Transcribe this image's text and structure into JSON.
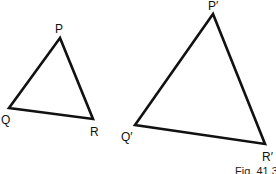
{
  "figure": {
    "caption": "Fig. 41.3",
    "stroke_color": "#111111",
    "background": "#ffffff"
  },
  "triangles": [
    {
      "name": "PQR",
      "vertices": {
        "P": {
          "label": "P",
          "x": 60,
          "y": 38
        },
        "Q": {
          "label": "Q",
          "x": 9,
          "y": 108
        },
        "R": {
          "label": "R",
          "x": 93,
          "y": 119
        }
      }
    },
    {
      "name": "P'Q'R'",
      "vertices": {
        "P": {
          "label": "P′",
          "x": 213,
          "y": 14
        },
        "Q": {
          "label": "Q′",
          "x": 135,
          "y": 125
        },
        "R": {
          "label": "R′",
          "x": 265,
          "y": 144
        }
      }
    }
  ]
}
